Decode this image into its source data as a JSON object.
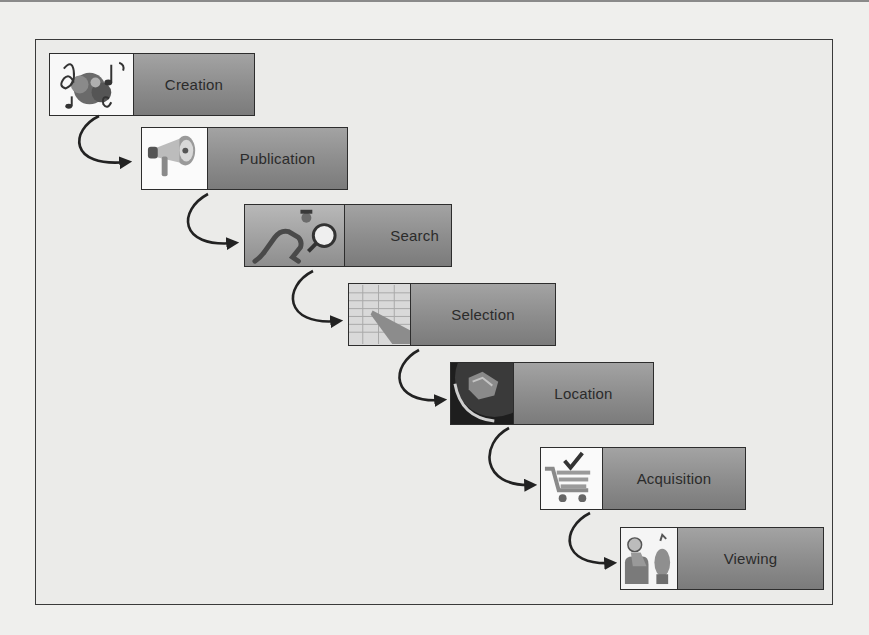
{
  "diagram": {
    "type": "process-flow",
    "direction": "staircase top-left to bottom-right",
    "colors": {
      "label_gradient_top": "#a3a3a3",
      "label_gradient_bottom": "#7b7b7b",
      "label_text": "#2b2b2b",
      "border": "#2d2d2d",
      "arrow": "#222222",
      "background": "#efefed"
    },
    "stages": [
      {
        "label": "Creation",
        "icon": "music-notes-icon"
      },
      {
        "label": "Publication",
        "icon": "megaphone-icon"
      },
      {
        "label": "Search",
        "icon": "detective-magnifier-icon"
      },
      {
        "label": "Selection",
        "icon": "hand-pointing-list-icon"
      },
      {
        "label": "Location",
        "icon": "globe-satellite-icon"
      },
      {
        "label": "Acquisition",
        "icon": "shopping-cart-check-icon"
      },
      {
        "label": "Viewing",
        "icon": "person-watching-icon"
      }
    ],
    "connectors": [
      {
        "from": "Creation",
        "to": "Publication"
      },
      {
        "from": "Publication",
        "to": "Search"
      },
      {
        "from": "Search",
        "to": "Selection"
      },
      {
        "from": "Selection",
        "to": "Location"
      },
      {
        "from": "Location",
        "to": "Acquisition"
      },
      {
        "from": "Acquisition",
        "to": "Viewing"
      }
    ]
  }
}
